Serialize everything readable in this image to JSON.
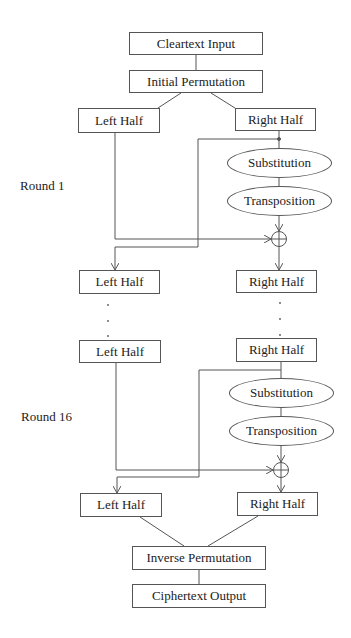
{
  "diagram": {
    "input": "Cleartext Input",
    "initial_permutation": "Initial Permutation",
    "round1": {
      "label": "Round 1",
      "left_in": "Left Half",
      "right_in": "Right Half",
      "substitution": "Substitution",
      "transposition": "Transposition",
      "xor_symbol": "⊕",
      "left_out": "Left Half",
      "right_out": "Right Half"
    },
    "ellipsis": "· · ·",
    "round16": {
      "label": "Round 16",
      "left_in": "Left Half",
      "right_in": "Right Half",
      "substitution": "Substitution",
      "transposition": "Transposition",
      "xor_symbol": "⊕",
      "left_out": "Left Half",
      "right_out": "Right Half"
    },
    "inverse_permutation": "Inverse Permutation",
    "output": "Ciphertext Output"
  }
}
